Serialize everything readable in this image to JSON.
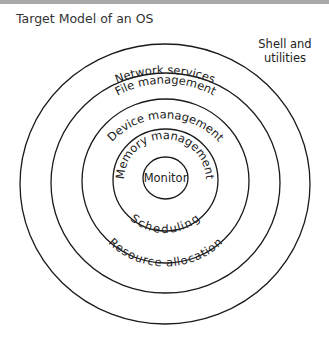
{
  "title": "Target Model of an OS",
  "rings": [
    {
      "label": "Network services",
      "position": "top"
    },
    {
      "label": "File management",
      "position": "top"
    },
    {
      "label": "Device management",
      "position": "top"
    },
    {
      "label": "Memory management",
      "position": "top"
    },
    {
      "label": "Monitor",
      "position": "center"
    }
  ],
  "bottom_labels": {
    "ring3": "Resource allocation",
    "ring4": "Scheduling"
  },
  "outside_label_line1": "Shell and",
  "outside_label_line2": "utilities"
}
